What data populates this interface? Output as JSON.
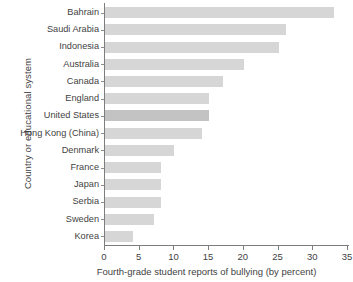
{
  "chart_data": {
    "type": "bar",
    "orientation": "horizontal",
    "title": "",
    "xlabel": "Fourth-grade student reports of bullying (by percent)",
    "ylabel": "Country or educational system",
    "categories": [
      "Bahrain",
      "Saudi Arabia",
      "Indonesia",
      "Australia",
      "Canada",
      "England",
      "United States",
      "Hong Kong (China)",
      "Denmark",
      "France",
      "Japan",
      "Serbia",
      "Sweden",
      "Korea"
    ],
    "values": [
      33,
      26,
      25,
      20,
      17,
      15,
      15,
      14,
      10,
      8,
      8,
      8,
      7,
      4
    ],
    "highlighted": [
      "United States"
    ],
    "xlim": [
      0,
      35
    ],
    "xticks": [
      0,
      5,
      10,
      15,
      20,
      25,
      30,
      35
    ],
    "xtick_labels": [
      "0",
      "5",
      "10",
      "15",
      "20",
      "25",
      "30",
      "35"
    ],
    "grid": false,
    "legend": null,
    "bar_color": "#d6d6d6",
    "highlight_color": "#c3c3c3",
    "axis_color": "#7d7d7d",
    "text_color": "#3f3f3f"
  }
}
